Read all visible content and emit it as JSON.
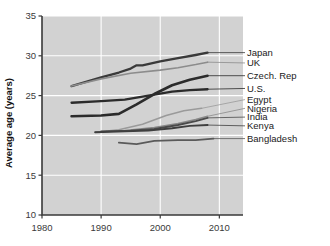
{
  "chart_data": {
    "type": "line",
    "title": "",
    "xlabel": "",
    "ylabel": "Average age (years)",
    "xlim": [
      1980,
      2014
    ],
    "ylim": [
      10,
      35
    ],
    "xticks": [
      1980,
      1990,
      2000,
      2010
    ],
    "yticks": [
      10,
      15,
      20,
      25,
      30,
      35
    ],
    "xtick_labels": [
      "1980",
      "1990",
      "2000",
      "2010"
    ],
    "ytick_labels": [
      "10",
      "15",
      "20",
      "25",
      "30",
      "35"
    ],
    "grid": true,
    "legend_position": "right-inline-labels",
    "plot_background": "#d2d2d2",
    "series": [
      {
        "name": "Japan",
        "label": "Japan",
        "color": "#3a3a3a",
        "width": 2.3,
        "x": [
          1985,
          1990,
          1993,
          1995,
          1996,
          1997,
          2000,
          2003,
          2006,
          2008
        ],
        "values": [
          26.2,
          27.3,
          27.9,
          28.4,
          28.8,
          28.8,
          29.3,
          29.7,
          30.1,
          30.4
        ]
      },
      {
        "name": "UK",
        "label": "UK",
        "color": "#8c8c8c",
        "width": 1.6,
        "x": [
          1985,
          1990,
          1995,
          2000,
          2003,
          2006,
          2008
        ],
        "values": [
          26.2,
          27.1,
          27.8,
          28.2,
          28.5,
          28.9,
          29.2
        ]
      },
      {
        "name": "Czech. Rep",
        "label": "Czech. Rep",
        "color": "#2b2b2b",
        "width": 2.6,
        "x": [
          1985,
          1990,
          1993,
          1996,
          1999,
          2002,
          2005,
          2008
        ],
        "values": [
          22.4,
          22.5,
          22.7,
          23.9,
          25.2,
          26.3,
          27.0,
          27.5
        ]
      },
      {
        "name": "U.S.",
        "label": "U.S.",
        "color": "#2b2b2b",
        "width": 2.3,
        "x": [
          1985,
          1990,
          1994,
          1998,
          2002,
          2005,
          2008
        ],
        "values": [
          24.1,
          24.3,
          24.5,
          25.0,
          25.5,
          25.7,
          25.8
        ]
      },
      {
        "name": "Egypt",
        "label": "Egypt",
        "color": "#9a9a9a",
        "width": 1.5,
        "x": [
          1989,
          1993,
          1997,
          2001,
          2004,
          2007
        ],
        "values": [
          20.4,
          20.7,
          21.4,
          22.5,
          23.1,
          23.4
        ]
      },
      {
        "name": "Nigeria",
        "label": "Nigeria",
        "color": "#8a8a8a",
        "width": 1.5,
        "x": [
          1989,
          1994,
          1999,
          2003,
          2006,
          2008
        ],
        "values": [
          20.4,
          20.6,
          21.0,
          21.5,
          22.0,
          22.4
        ]
      },
      {
        "name": "India",
        "label": "India",
        "color": "#4a4a4a",
        "width": 1.9,
        "x": [
          1990,
          1995,
          1999,
          2003,
          2006,
          2008
        ],
        "values": [
          20.5,
          20.6,
          20.8,
          21.3,
          21.8,
          22.2
        ]
      },
      {
        "name": "Kenya",
        "label": "Kenya",
        "color": "#3f3f3f",
        "width": 1.9,
        "x": [
          1989,
          1994,
          1998,
          2002,
          2005,
          2008
        ],
        "values": [
          20.4,
          20.5,
          20.6,
          20.9,
          21.2,
          21.3
        ]
      },
      {
        "name": "Bangladesh",
        "label": "Bangladesh",
        "color": "#5a5a5a",
        "width": 1.8,
        "x": [
          1993,
          1996,
          1999,
          2003,
          2006,
          2009
        ],
        "values": [
          19.1,
          18.9,
          19.3,
          19.4,
          19.4,
          19.6
        ]
      }
    ],
    "label_anchors": [
      {
        "name": "Japan",
        "y_value": 30.4
      },
      {
        "name": "UK",
        "y_value": 29.1
      },
      {
        "name": "Czech. Rep",
        "y_value": 27.5
      },
      {
        "name": "U.S.",
        "y_value": 25.9
      },
      {
        "name": "Egypt",
        "y_value": 24.5
      },
      {
        "name": "Nigeria",
        "y_value": 23.4
      },
      {
        "name": "India",
        "y_value": 22.3
      },
      {
        "name": "Kenya",
        "y_value": 21.2
      },
      {
        "name": "Bangladesh",
        "y_value": 19.6
      }
    ]
  }
}
